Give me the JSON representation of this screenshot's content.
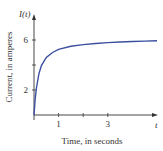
{
  "chart_data": {
    "type": "line",
    "title": "",
    "xlabel": "Time, in seconds",
    "ylabel": "Current, in amperes",
    "x_axis_var": "t",
    "y_axis_var": "I(t)",
    "x_ticks": [
      1,
      2,
      3
    ],
    "x_tick_labels": [
      "1",
      "",
      "3"
    ],
    "y_ticks": [
      2,
      4,
      6
    ],
    "y_tick_labels": [
      "2",
      "",
      "6"
    ],
    "xlim": [
      0,
      5
    ],
    "ylim": [
      0,
      7.5
    ],
    "grid": false,
    "series": [
      {
        "name": "I(t)",
        "color": "#3b4fa0",
        "x": [
          0,
          0.05,
          0.1,
          0.2,
          0.3,
          0.5,
          0.75,
          1,
          1.5,
          2,
          2.5,
          3,
          3.5,
          4,
          4.5,
          5
        ],
        "y": [
          0,
          1.3,
          2.2,
          3.3,
          3.95,
          4.6,
          5.0,
          5.25,
          5.5,
          5.63,
          5.72,
          5.79,
          5.84,
          5.88,
          5.91,
          5.94
        ]
      }
    ]
  }
}
